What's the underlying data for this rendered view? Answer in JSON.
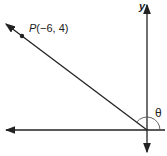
{
  "diagram": {
    "point_label_name": "P",
    "point_label_coords": "(−6, 4)",
    "y_axis_label": "y",
    "angle_label": "θ",
    "colors": {
      "line": "#222222",
      "background": "#ffffff"
    }
  }
}
